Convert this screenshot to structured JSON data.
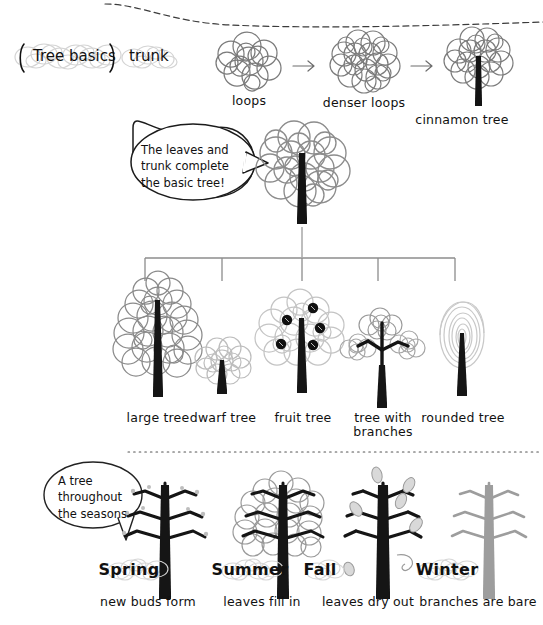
{
  "page": {
    "title": "Tree basics",
    "background": "#ffffff",
    "ink_dark": "#1a1a1a",
    "ink_mid": "#7b7b7b",
    "ink_light": "#c9c9c9",
    "highlight": "#d8d8d8"
  },
  "header": {
    "section_label": "Tree basics",
    "trunk_label": "trunk"
  },
  "progression": {
    "arrow_glyph": "→",
    "steps": [
      {
        "label": "loops",
        "kind": "loops"
      },
      {
        "label": "denser loops",
        "kind": "denser-loops"
      },
      {
        "label": "cinnamon tree",
        "kind": "cinnamon-tree"
      }
    ]
  },
  "callout": {
    "text": "The leaves and\ntrunk complete\nthe basic tree!"
  },
  "varieties": {
    "items": [
      {
        "label": "large tree"
      },
      {
        "label": "dwarf tree"
      },
      {
        "label": "fruit tree"
      },
      {
        "label": "tree with\nbranches"
      },
      {
        "label": "rounded tree"
      }
    ]
  },
  "seasons_callout": {
    "text": "A tree\nthroughout\nthe seasons"
  },
  "seasons": {
    "items": [
      {
        "name": "Spring",
        "caption": "new buds form"
      },
      {
        "name": "Summer",
        "caption": "leaves fill in"
      },
      {
        "name": "Fall",
        "caption": "leaves dry out"
      },
      {
        "name": "Winter",
        "caption": "branches are bare"
      }
    ]
  }
}
